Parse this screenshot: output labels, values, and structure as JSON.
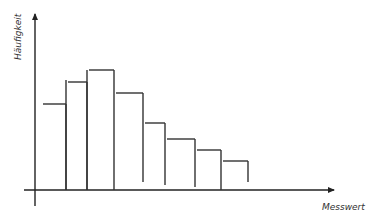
{
  "chart_data": {
    "type": "bar",
    "subtype": "histogram",
    "title": "",
    "xlabel": "Messwert",
    "ylabel": "Häufigkeit",
    "grid": false,
    "legend": null,
    "ticks": "none",
    "bins": [
      {
        "x0": 39,
        "x1": 66,
        "height": 86
      },
      {
        "x0": 66,
        "x1": 87,
        "height": 108
      },
      {
        "x0": 87,
        "x1": 114,
        "height": 120
      },
      {
        "x0": 114,
        "x1": 143,
        "height": 97
      },
      {
        "x0": 143,
        "x1": 165,
        "height": 67
      },
      {
        "x0": 165,
        "x1": 195,
        "height": 51
      },
      {
        "x0": 195,
        "x1": 221,
        "height": 40
      },
      {
        "x0": 221,
        "x1": 248,
        "height": 29
      }
    ],
    "categories": [
      "1",
      "2",
      "3",
      "4",
      "5",
      "6",
      "7",
      "8"
    ],
    "values": [
      86,
      108,
      120,
      97,
      67,
      51,
      40,
      29
    ],
    "note": "Hand-drawn sketch histogram without numeric ticks; values are relative bar heights in pixels above the x-axis."
  },
  "axes": {
    "x_label": "Messwert",
    "y_label": "Häufigkeit"
  },
  "colors": {
    "stroke": "#333333",
    "background": "#ffffff"
  }
}
